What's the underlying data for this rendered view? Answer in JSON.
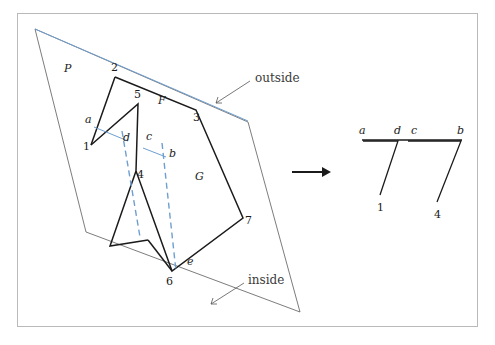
{
  "figure": {
    "frame": {
      "x": 17,
      "y": 13,
      "width": 461,
      "height": 314,
      "border_color": "#b9b9b9"
    },
    "colors": {
      "outline": "#1b1b1b",
      "plane": "#5a5a5a",
      "cut_line": "#6f9fd0",
      "label": "#1b1b1b",
      "word_label": "#3a3a3a"
    }
  },
  "plane": {
    "name_label": "P",
    "name_label_pos": {
      "x": 64,
      "y": 72
    },
    "points": "35,29 248,122 300,312 86,232"
  },
  "cut": {
    "top_line": {
      "x1": 35,
      "y1": 29,
      "x2": 248,
      "y2": 121
    },
    "dash_left": {
      "x1": 122,
      "y1": 131,
      "x2": 140,
      "y2": 237
    },
    "dash_right": {
      "x1": 162,
      "y1": 143,
      "x2": 176,
      "y2": 271
    },
    "seg_a_d": {
      "x1": 94,
      "y1": 127,
      "x2": 128,
      "y2": 141
    },
    "seg_c_b": {
      "x1": 143,
      "y1": 148,
      "x2": 166,
      "y2": 157
    }
  },
  "polygon": {
    "face_labels": [
      {
        "text": "F",
        "x": 158,
        "y": 104
      },
      {
        "text": "G",
        "x": 195,
        "y": 180
      }
    ],
    "main_outline": "115,77 196,110 243,218 172,271 136,171 138,104 91,145",
    "tail_outline": "136,171 110,246 148,240",
    "tail_edge_b": "148,240 172,271"
  },
  "vertices": [
    {
      "id": "2",
      "x": 115,
      "y": 77,
      "label_x": 111,
      "label_y": 71
    },
    {
      "id": "5",
      "x": 138,
      "y": 104,
      "label_x": 134,
      "label_y": 98
    },
    {
      "id": "3",
      "x": 196,
      "y": 110,
      "label_x": 193,
      "label_y": 121
    },
    {
      "id": "1",
      "x": 91,
      "y": 145,
      "label_x": 83,
      "label_y": 150
    },
    {
      "id": "4",
      "x": 136,
      "y": 171,
      "label_x": 137,
      "label_y": 175
    },
    {
      "id": "7",
      "x": 243,
      "y": 218,
      "label_x": 245,
      "label_y": 224
    },
    {
      "id": "6",
      "x": 172,
      "y": 271,
      "label_x": 166,
      "label_y": 285
    }
  ],
  "cut_points": [
    {
      "id": "a",
      "x": 94,
      "y": 127,
      "label_x": 86,
      "label_y": 122
    },
    {
      "id": "d",
      "x": 128,
      "y": 141,
      "label_x": 123,
      "label_y": 139
    },
    {
      "id": "c",
      "x": 143,
      "y": 148,
      "label_x": 146,
      "label_y": 138
    },
    {
      "id": "b",
      "x": 166,
      "y": 157,
      "label_x": 168,
      "label_y": 154
    },
    {
      "id": "e",
      "x": 188,
      "y": 262,
      "label_x": 187,
      "label_y": 265
    }
  ],
  "annotations": {
    "outside": {
      "text": "outside",
      "label_x": 255,
      "label_y": 79,
      "leader": {
        "x1": 250,
        "y1": 81,
        "x2": 215,
        "y2": 104
      }
    },
    "inside": {
      "text": "inside",
      "label_x": 248,
      "label_y": 285,
      "leader": {
        "x1": 244,
        "y1": 283,
        "x2": 210,
        "y2": 304
      }
    }
  },
  "transform_arrow": {
    "name": "maps-to-arrow",
    "x1": 292,
    "y1": 172,
    "x2": 325,
    "y2": 172
  },
  "result": {
    "top_line": {
      "x1": 362,
      "y1": 140,
      "x2": 462,
      "y2": 140
    },
    "triangles": [
      {
        "name": "triangle-a-d-1",
        "path": "363,141 398,141 380,195",
        "apex_label": "1",
        "apex_label_x": 377,
        "apex_label_y": 210
      },
      {
        "name": "triangle-c-b-4",
        "path": "408,141 461,141 437,202",
        "apex_label": "4",
        "apex_label_x": 434,
        "apex_label_y": 217
      }
    ],
    "top_labels": [
      {
        "text": "a",
        "x": 360,
        "y": 133
      },
      {
        "text": "d",
        "x": 395,
        "y": 133
      },
      {
        "text": "c",
        "x": 411,
        "y": 133
      },
      {
        "text": "b",
        "x": 458,
        "y": 133
      }
    ]
  }
}
